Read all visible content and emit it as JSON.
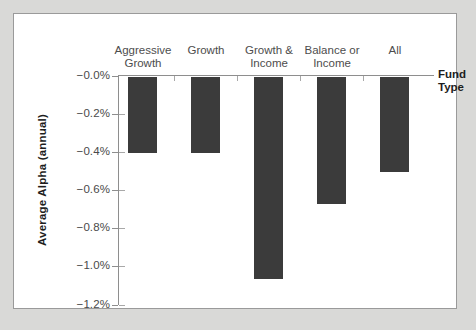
{
  "chart_data": {
    "type": "bar",
    "title": "",
    "subtitle": "",
    "xlabel": "Fund Type",
    "ylabel": "Average Alpha (annual)",
    "categories": [
      "Aggressive\nGrowth",
      "Growth",
      "Growth &\nIncome",
      "Balance or\nIncome",
      "All"
    ],
    "values": [
      -0.4,
      -0.4,
      -1.06,
      -0.67,
      -0.5
    ],
    "ylim": [
      -1.2,
      0.0
    ],
    "ytick_values": [
      -0.0,
      -0.2,
      -0.4,
      -0.6,
      -0.8,
      -1.0,
      -1.2
    ],
    "ytick_labels": [
      "−0.0%",
      "−0.2%",
      "−0.4%",
      "−0.6%",
      "−0.8%",
      "−1.0%",
      "−1.2%"
    ],
    "grid": false,
    "legend": null,
    "bar_color": "#3b3b3b",
    "axis_color": "#8e8e8e",
    "xaxis_position": "top",
    "category_label_position": "above-axis"
  },
  "figure": {
    "background_color": "#d9d9d7",
    "panel_color": "#ffffff",
    "panel_border_color": "#9a9a9a"
  }
}
